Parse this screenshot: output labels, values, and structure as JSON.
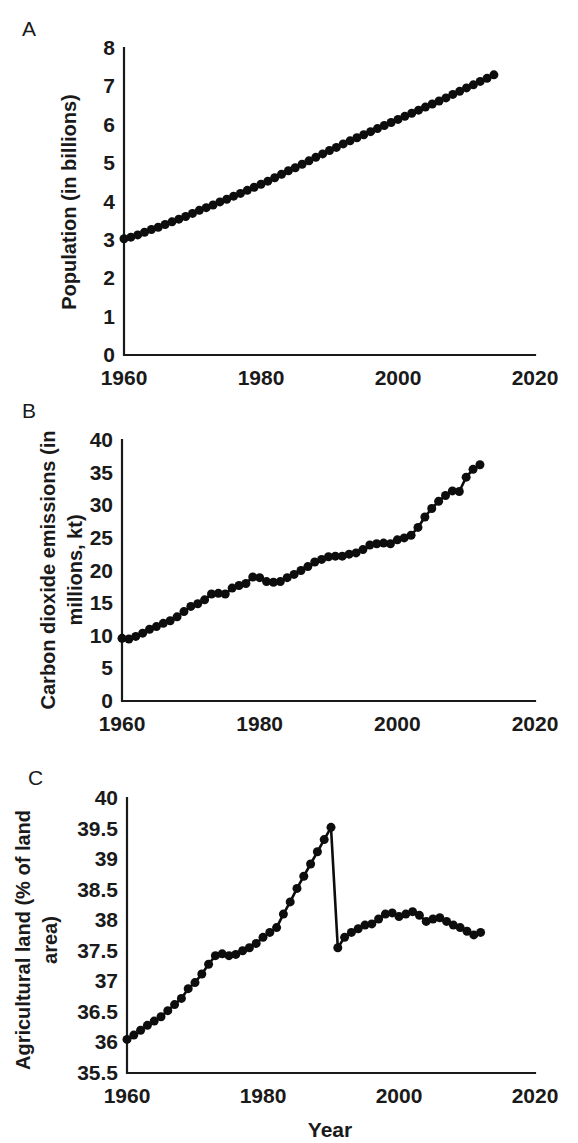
{
  "figure": {
    "panels": [
      {
        "letter": "A",
        "ylabel": "Population (in billions)",
        "xlabel": "",
        "xticks": [
          "1960",
          "1980",
          "2000",
          "2020"
        ],
        "yticks": [
          "0",
          "1",
          "2",
          "3",
          "4",
          "5",
          "6",
          "7",
          "8"
        ]
      },
      {
        "letter": "B",
        "ylabel_line1": "Carbon dioxide emissions (in",
        "ylabel_line2": "millions, kt)",
        "xlabel": "",
        "xticks": [
          "1960",
          "1980",
          "2000",
          "2020"
        ],
        "yticks": [
          "0",
          "5",
          "10",
          "15",
          "20",
          "25",
          "30",
          "35",
          "40"
        ]
      },
      {
        "letter": "C",
        "ylabel_line1": "Agricultural land (% of land",
        "ylabel_line2": "area)",
        "xlabel": "Year",
        "xticks": [
          "1960",
          "1980",
          "2000",
          "2020"
        ],
        "yticks": [
          "35.5",
          "36",
          "36.5",
          "37",
          "37.5",
          "38",
          "38.5",
          "39",
          "39.5",
          "40"
        ]
      }
    ]
  },
  "colors": {
    "ink": "#1a1a1a",
    "marker": "#0d0d0d",
    "background": "#ffffff"
  },
  "chart_data": [
    {
      "type": "scatter",
      "panel": "A",
      "title": "",
      "xlabel": "",
      "ylabel": "Population (in billions)",
      "xlim": [
        1960,
        2020
      ],
      "ylim": [
        0,
        8
      ],
      "xticks": [
        1960,
        1980,
        2000,
        2020
      ],
      "yticks": [
        0,
        1,
        2,
        3,
        4,
        5,
        6,
        7,
        8
      ],
      "grid": false,
      "legend": "none",
      "x": [
        1960,
        1961,
        1962,
        1963,
        1964,
        1965,
        1966,
        1967,
        1968,
        1969,
        1970,
        1971,
        1972,
        1973,
        1974,
        1975,
        1976,
        1977,
        1978,
        1979,
        1980,
        1981,
        1982,
        1983,
        1984,
        1985,
        1986,
        1987,
        1988,
        1989,
        1990,
        1991,
        1992,
        1993,
        1994,
        1995,
        1996,
        1997,
        1998,
        1999,
        2000,
        2001,
        2002,
        2003,
        2004,
        2005,
        2006,
        2007,
        2008,
        2009,
        2010,
        2011,
        2012,
        2013,
        2014
      ],
      "y": [
        3.03,
        3.07,
        3.13,
        3.2,
        3.27,
        3.33,
        3.4,
        3.47,
        3.54,
        3.61,
        3.69,
        3.77,
        3.84,
        3.91,
        3.99,
        4.06,
        4.14,
        4.21,
        4.29,
        4.37,
        4.45,
        4.53,
        4.62,
        4.71,
        4.8,
        4.88,
        4.97,
        5.06,
        5.15,
        5.24,
        5.33,
        5.41,
        5.5,
        5.58,
        5.66,
        5.74,
        5.82,
        5.9,
        5.98,
        6.06,
        6.14,
        6.22,
        6.3,
        6.38,
        6.46,
        6.54,
        6.62,
        6.7,
        6.79,
        6.87,
        6.96,
        7.04,
        7.13,
        7.21,
        7.3
      ]
    },
    {
      "type": "scatter",
      "panel": "B",
      "title": "",
      "xlabel": "",
      "ylabel": "Carbon dioxide emissions (in millions, kt)",
      "xlim": [
        1960,
        2020
      ],
      "ylim": [
        0,
        40
      ],
      "xticks": [
        1960,
        1980,
        2000,
        2020
      ],
      "yticks": [
        0,
        5,
        10,
        15,
        20,
        25,
        30,
        35,
        40
      ],
      "grid": false,
      "legend": "none",
      "x": [
        1960,
        1961,
        1962,
        1963,
        1964,
        1965,
        1966,
        1967,
        1968,
        1969,
        1970,
        1971,
        1972,
        1973,
        1974,
        1975,
        1976,
        1977,
        1978,
        1979,
        1980,
        1981,
        1982,
        1983,
        1984,
        1985,
        1986,
        1987,
        1988,
        1989,
        1990,
        1991,
        1992,
        1993,
        1994,
        1995,
        1996,
        1997,
        1998,
        1999,
        2000,
        2001,
        2002,
        2003,
        2004,
        2005,
        2006,
        2007,
        2008,
        2009,
        2010,
        2011,
        2012
      ],
      "y": [
        9.6,
        9.5,
        9.9,
        10.4,
        11.0,
        11.4,
        11.9,
        12.3,
        12.9,
        13.7,
        14.5,
        14.9,
        15.5,
        16.4,
        16.5,
        16.4,
        17.3,
        17.7,
        18.0,
        19.0,
        18.9,
        18.3,
        18.2,
        18.3,
        18.9,
        19.4,
        20.0,
        20.6,
        21.3,
        21.7,
        22.1,
        22.2,
        22.2,
        22.5,
        22.7,
        23.2,
        23.9,
        24.1,
        24.2,
        24.1,
        24.7,
        25.0,
        25.4,
        26.6,
        28.2,
        29.5,
        30.6,
        31.5,
        32.2,
        32.1,
        34.3,
        35.5,
        36.2
      ]
    },
    {
      "type": "scatter",
      "panel": "C",
      "title": "",
      "xlabel": "Year",
      "ylabel": "Agricultural land (% of land area)",
      "xlim": [
        1960,
        2020
      ],
      "ylim": [
        35.5,
        40
      ],
      "xticks": [
        1960,
        1980,
        2000,
        2020
      ],
      "yticks": [
        35.5,
        36,
        36.5,
        37,
        37.5,
        38,
        38.5,
        39,
        39.5,
        40
      ],
      "grid": false,
      "legend": "none",
      "discontinuity_year": 1990,
      "x": [
        1960,
        1961,
        1962,
        1963,
        1964,
        1965,
        1966,
        1967,
        1968,
        1969,
        1970,
        1971,
        1972,
        1973,
        1974,
        1975,
        1976,
        1977,
        1978,
        1979,
        1980,
        1981,
        1982,
        1983,
        1984,
        1985,
        1986,
        1987,
        1988,
        1989,
        1990,
        1991,
        1992,
        1993,
        1994,
        1995,
        1996,
        1997,
        1998,
        1999,
        2000,
        2001,
        2002,
        2003,
        2004,
        2005,
        2006,
        2007,
        2008,
        2009,
        2010,
        2011,
        2012
      ],
      "y": [
        36.05,
        36.12,
        36.2,
        36.28,
        36.35,
        36.42,
        36.52,
        36.62,
        36.72,
        36.88,
        36.98,
        37.12,
        37.28,
        37.42,
        37.45,
        37.42,
        37.44,
        37.5,
        37.55,
        37.62,
        37.72,
        37.8,
        37.88,
        38.1,
        38.3,
        38.52,
        38.72,
        38.92,
        39.12,
        39.32,
        39.52,
        37.55,
        37.72,
        37.8,
        37.86,
        37.92,
        37.94,
        38.02,
        38.1,
        38.12,
        38.06,
        38.1,
        38.14,
        38.08,
        37.98,
        38.02,
        38.04,
        37.98,
        37.92,
        37.88,
        37.82,
        37.76,
        37.8
      ]
    }
  ]
}
